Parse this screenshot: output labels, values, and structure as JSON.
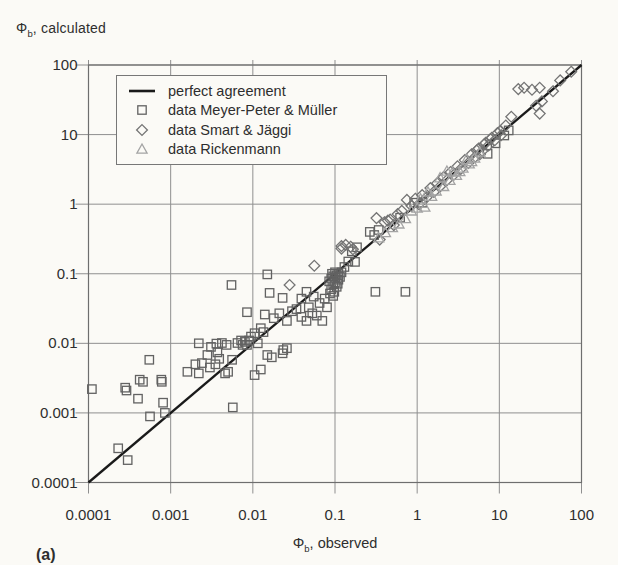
{
  "figure_label": "(a)",
  "colors": {
    "background": "#fbfaf6",
    "text": "#2e2e2e",
    "grid": "#8f8f8f",
    "frame": "#6e6e6e",
    "line": "#1a1a1a",
    "squares": "#626262",
    "diamonds": "#747474",
    "triangles": "#a4a4a4",
    "legend_border": "#777777"
  },
  "chart_data": {
    "type": "scatter",
    "x_axis": {
      "label_symbol": "Φ",
      "label_sub": "b",
      "label_rest": ", observed",
      "scale": "log",
      "min": 0.0001,
      "max": 100,
      "ticks": [
        "0.0001",
        "0.001",
        "0.01",
        "0.1",
        "1",
        "10",
        "100"
      ]
    },
    "y_axis": {
      "label_symbol": "Φ",
      "label_sub": "b",
      "label_rest": ", calculated",
      "scale": "log",
      "min": 0.0001,
      "max": 100,
      "ticks": [
        "0.0001",
        "0.001",
        "0.01",
        "0.1",
        "1",
        "10",
        "100"
      ]
    },
    "grid": true,
    "legend": {
      "position": "top-left",
      "items": [
        {
          "type": "line",
          "label": "perfect agreement"
        },
        {
          "type": "square",
          "label": "data Meyer-Peter & Müller"
        },
        {
          "type": "diamond",
          "label": "data Smart & Jäggi"
        },
        {
          "type": "triangle",
          "label": "data Rickenmann"
        }
      ]
    },
    "reference_line": {
      "name": "perfect agreement",
      "from": [
        0.0001,
        0.0001
      ],
      "to": [
        100,
        100
      ]
    },
    "series": [
      {
        "name": "data Meyer-Peter & Müller",
        "marker": "square",
        "points": [
          [
            0.00011,
            0.0022
          ],
          [
            0.00023,
            0.00031
          ],
          [
            0.0003,
            0.00021
          ],
          [
            0.00028,
            0.0023
          ],
          [
            0.00029,
            0.0021
          ],
          [
            0.00042,
            0.003
          ],
          [
            0.00046,
            0.0028
          ],
          [
            0.0004,
            0.0016
          ],
          [
            0.00055,
            0.0058
          ],
          [
            0.00056,
            0.00089
          ],
          [
            0.00078,
            0.0028
          ],
          [
            0.00081,
            0.0014
          ],
          [
            0.00085,
            0.001
          ],
          [
            0.00077,
            0.003
          ],
          [
            0.0016,
            0.0039
          ],
          [
            0.002,
            0.005
          ],
          [
            0.0022,
            0.0037
          ],
          [
            0.0024,
            0.0052
          ],
          [
            0.0028,
            0.0068
          ],
          [
            0.0022,
            0.01
          ],
          [
            0.0036,
            0.0099
          ],
          [
            0.0037,
            0.0074
          ],
          [
            0.0042,
            0.0101
          ],
          [
            0.0048,
            0.0095
          ],
          [
            0.005,
            0.0039
          ],
          [
            0.0057,
            0.0012
          ],
          [
            0.0055,
            0.069
          ],
          [
            0.0056,
            0.0058
          ],
          [
            0.0046,
            0.0037
          ],
          [
            0.0035,
            0.005
          ],
          [
            0.003,
            0.0045
          ],
          [
            0.0039,
            0.006
          ],
          [
            0.0031,
            0.0089
          ],
          [
            0.0065,
            0.0101
          ],
          [
            0.0072,
            0.011
          ],
          [
            0.008,
            0.0105
          ],
          [
            0.009,
            0.011
          ],
          [
            0.0085,
            0.0095
          ],
          [
            0.0095,
            0.0125
          ],
          [
            0.0075,
            0.0095
          ],
          [
            0.0085,
            0.028
          ],
          [
            0.0105,
            0.014
          ],
          [
            0.0115,
            0.01
          ],
          [
            0.0125,
            0.0165
          ],
          [
            0.0135,
            0.0145
          ],
          [
            0.0105,
            0.0035
          ],
          [
            0.0125,
            0.0042
          ],
          [
            0.015,
            0.0068
          ],
          [
            0.023,
            0.0072
          ],
          [
            0.0235,
            0.008
          ],
          [
            0.015,
            0.098
          ],
          [
            0.016,
            0.053
          ],
          [
            0.023,
            0.045
          ],
          [
            0.017,
            0.0063
          ],
          [
            0.026,
            0.0085
          ],
          [
            0.014,
            0.026
          ],
          [
            0.018,
            0.023
          ],
          [
            0.021,
            0.027
          ],
          [
            0.026,
            0.021
          ],
          [
            0.03,
            0.029
          ],
          [
            0.034,
            0.031
          ],
          [
            0.039,
            0.024
          ],
          [
            0.045,
            0.021
          ],
          [
            0.048,
            0.033
          ],
          [
            0.053,
            0.027
          ],
          [
            0.039,
            0.044
          ],
          [
            0.045,
            0.055
          ],
          [
            0.055,
            0.047
          ],
          [
            0.06,
            0.025
          ],
          [
            0.065,
            0.038
          ],
          [
            0.07,
            0.021
          ],
          [
            0.075,
            0.044
          ],
          [
            0.08,
            0.033
          ],
          [
            0.085,
            0.078
          ],
          [
            0.09,
            0.085
          ],
          [
            0.095,
            0.092
          ],
          [
            0.1,
            0.088
          ],
          [
            0.105,
            0.095
          ],
          [
            0.11,
            0.082
          ],
          [
            0.095,
            0.07
          ],
          [
            0.1,
            0.075
          ],
          [
            0.105,
            0.065
          ],
          [
            0.09,
            0.06
          ],
          [
            0.098,
            0.055
          ],
          [
            0.11,
            0.1
          ],
          [
            0.115,
            0.09
          ],
          [
            0.12,
            0.105
          ],
          [
            0.092,
            0.1
          ],
          [
            0.1,
            0.105
          ],
          [
            0.108,
            0.072
          ],
          [
            0.095,
            0.048
          ],
          [
            0.087,
            0.052
          ],
          [
            0.13,
            0.125
          ],
          [
            0.145,
            0.15
          ],
          [
            0.175,
            0.148
          ],
          [
            0.16,
            0.21
          ],
          [
            0.185,
            0.24
          ],
          [
            0.265,
            0.4
          ],
          [
            0.3,
            0.36
          ],
          [
            0.34,
            0.425
          ],
          [
            0.31,
            0.055
          ],
          [
            0.72,
            0.055
          ],
          [
            0.62,
            0.64
          ],
          [
            0.92,
            1.05
          ],
          [
            1.15,
            1.05
          ],
          [
            7.2,
            5.3
          ],
          [
            9.0,
            7.5
          ],
          [
            11.5,
            9.7
          ],
          [
            13,
            11.5
          ]
        ]
      },
      {
        "name": "data Smart & Jäggi",
        "marker": "diamond",
        "points": [
          [
            0.028,
            0.069
          ],
          [
            0.056,
            0.13
          ],
          [
            0.12,
            0.23
          ],
          [
            0.135,
            0.26
          ],
          [
            0.155,
            0.245
          ],
          [
            0.165,
            0.225
          ],
          [
            0.12,
            0.25
          ],
          [
            0.35,
            0.31
          ],
          [
            0.4,
            0.55
          ],
          [
            0.44,
            0.58
          ],
          [
            0.47,
            0.6
          ],
          [
            0.32,
            0.63
          ],
          [
            0.52,
            0.5
          ],
          [
            0.58,
            0.72
          ],
          [
            0.65,
            0.8
          ],
          [
            0.75,
            1.15
          ],
          [
            0.85,
            0.95
          ],
          [
            0.95,
            1.2
          ],
          [
            1.05,
            1.0
          ],
          [
            1.15,
            1.35
          ],
          [
            1.3,
            1.25
          ],
          [
            1.45,
            1.7
          ],
          [
            1.6,
            1.5
          ],
          [
            1.75,
            2.0
          ],
          [
            1.9,
            1.8
          ],
          [
            2.1,
            2.45
          ],
          [
            2.3,
            2.2
          ],
          [
            2.55,
            2.9
          ],
          [
            2.8,
            2.65
          ],
          [
            3.1,
            3.5
          ],
          [
            3.4,
            3.2
          ],
          [
            3.8,
            4.3
          ],
          [
            4.2,
            3.9
          ],
          [
            4.6,
            5.2
          ],
          [
            5.1,
            4.8
          ],
          [
            5.3,
            5.9
          ],
          [
            5.6,
            6.3
          ],
          [
            5.8,
            5.2
          ],
          [
            6.2,
            5.8
          ],
          [
            6.5,
            7.2
          ],
          [
            6.8,
            7.6
          ],
          [
            7.4,
            7.0
          ],
          [
            7.8,
            8.6
          ],
          [
            8.1,
            9.0
          ],
          [
            8.8,
            8.3
          ],
          [
            9.5,
            10.5
          ],
          [
            10.2,
            11.2
          ],
          [
            10.5,
            9.8
          ],
          [
            12,
            13.5
          ],
          [
            14,
            18
          ],
          [
            17,
            45
          ],
          [
            20,
            47
          ],
          [
            25,
            44
          ],
          [
            31,
            47
          ],
          [
            28,
            26
          ],
          [
            31,
            20
          ],
          [
            33,
            30
          ],
          [
            45,
            42
          ],
          [
            55,
            60
          ],
          [
            75,
            80
          ]
        ]
      },
      {
        "name": "data Rickenmann",
        "marker": "triangle",
        "points": [
          [
            0.34,
            0.33
          ],
          [
            0.41,
            0.39
          ],
          [
            0.5,
            0.46
          ],
          [
            0.6,
            0.52
          ],
          [
            0.72,
            0.62
          ],
          [
            0.85,
            0.8
          ],
          [
            1.0,
            0.88
          ],
          [
            1.1,
            1.2
          ],
          [
            1.24,
            0.91
          ],
          [
            1.35,
            1.5
          ],
          [
            1.5,
            1.3
          ],
          [
            1.7,
            1.55
          ],
          [
            1.9,
            2.4
          ],
          [
            2.1,
            1.8
          ],
          [
            2.3,
            3.0
          ],
          [
            2.5,
            2.2
          ],
          [
            2.7,
            2.9
          ],
          [
            3.0,
            2.6
          ],
          [
            3.3,
            2.95
          ],
          [
            3.6,
            3.3
          ],
          [
            4.0,
            4.4
          ],
          [
            4.3,
            3.8
          ],
          [
            4.6,
            4.1
          ],
          [
            5.0,
            4.6
          ],
          [
            5.8,
            5.6
          ]
        ]
      }
    ]
  }
}
